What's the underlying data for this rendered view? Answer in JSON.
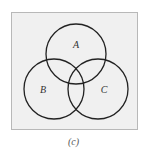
{
  "figure": {
    "caption": "(c)",
    "background_color": "#f0f0f0",
    "border_color": "#b8b8b8",
    "stroke_color": "#222222",
    "sets": [
      {
        "label": "A",
        "cx": 76,
        "cy": 54,
        "r": 30
      },
      {
        "label": "B",
        "cx": 54,
        "cy": 89,
        "r": 30
      },
      {
        "label": "C",
        "cx": 98,
        "cy": 89,
        "r": 30
      }
    ]
  }
}
